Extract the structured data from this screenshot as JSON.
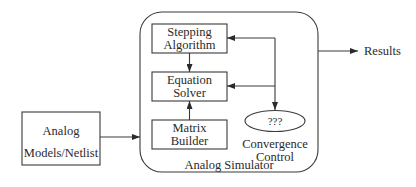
{
  "diagram": {
    "container": {
      "label": "Analog Simulator"
    },
    "nodes": {
      "stepping": {
        "line1": "Stepping",
        "line2": "Algorithm"
      },
      "solver": {
        "line1": "Equation",
        "line2": "Solver"
      },
      "matrix": {
        "line1": "Matrix",
        "line2": "Builder"
      },
      "input": {
        "line1": "Analog",
        "line2": "Models/Netlist"
      },
      "convergence": {
        "inner": "???",
        "line1": "Convergence",
        "line2": "Control"
      }
    },
    "output": {
      "label": "Results"
    },
    "edges": [
      {
        "from": "Analog Models/Netlist",
        "to": "Analog Simulator"
      },
      {
        "from": "Stepping Algorithm",
        "to": "Equation Solver"
      },
      {
        "from": "Matrix Builder",
        "to": "Equation Solver"
      },
      {
        "from": "Convergence Control",
        "to": "Stepping Algorithm"
      },
      {
        "from": "Convergence Control",
        "to": "Equation Solver"
      },
      {
        "from": "Stepping Algorithm",
        "to": "Convergence Control"
      },
      {
        "from": "Analog Simulator",
        "to": "Results"
      }
    ]
  }
}
